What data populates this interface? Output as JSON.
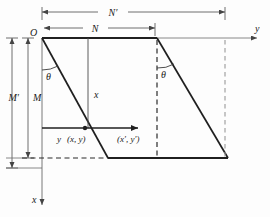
{
  "figure": {
    "background_color": "#fdfdfd",
    "line_color": "#262626",
    "thin_line_color": "#555555",
    "dashed_light_color": "#999999",
    "labels": {
      "origin": "O",
      "axis_y": "y",
      "axis_x": "x",
      "dim_N": "N",
      "dim_N_prime": "N′",
      "dim_M": "M",
      "dim_M_prime": "M′",
      "height_x": "x",
      "offset_y": "y",
      "angle_left": "θ",
      "angle_right": "θ",
      "point_source": "(x, y)",
      "point_target": "(x′, y′)"
    },
    "geometry": {
      "origin_px": [
        42,
        38
      ],
      "top_edge_end_px": [
        157,
        38
      ],
      "y_axis_arrow_end_px": [
        257,
        38
      ],
      "x_axis_arrow_end_px": [
        42,
        205
      ],
      "bottom_edge_px": [
        108,
        158,
        228,
        158
      ],
      "parallelogram_left_slant": [
        42,
        38,
        108,
        158
      ],
      "parallelogram_right_slant": [
        157,
        38,
        228,
        158
      ],
      "dashed_vertical_inner_px": 157,
      "dashed_vertical_outer_px": 225,
      "dim_N_extent_px": [
        42,
        155
      ],
      "dim_N_prime_extent_px": [
        42,
        225
      ],
      "dim_M_extent_px": [
        38,
        158
      ],
      "dim_M_prime_extent_px": [
        38,
        168
      ],
      "point_source_px": [
        85,
        128
      ],
      "point_target_px": [
        138,
        128
      ],
      "height_line_px": [
        88,
        38,
        88,
        128
      ]
    }
  }
}
